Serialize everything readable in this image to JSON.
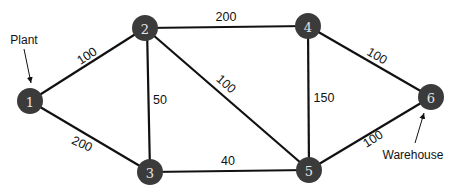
{
  "diagram": {
    "type": "network-graph",
    "nodes": [
      {
        "id": "1",
        "label": "1",
        "x": 30,
        "y": 101
      },
      {
        "id": "2",
        "label": "2",
        "x": 145,
        "y": 28
      },
      {
        "id": "3",
        "label": "3",
        "x": 150,
        "y": 172
      },
      {
        "id": "4",
        "label": "4",
        "x": 308,
        "y": 26
      },
      {
        "id": "5",
        "label": "5",
        "x": 309,
        "y": 170
      },
      {
        "id": "6",
        "label": "6",
        "x": 431,
        "y": 97
      }
    ],
    "edges": [
      {
        "from": "1",
        "to": "2",
        "weight": "100",
        "lx": 87,
        "ly": 56,
        "rot": -33
      },
      {
        "from": "1",
        "to": "3",
        "weight": "200",
        "lx": 82,
        "ly": 144,
        "rot": 25
      },
      {
        "from": "2",
        "to": "3",
        "weight": "50",
        "lx": 160,
        "ly": 100,
        "rot": 0
      },
      {
        "from": "2",
        "to": "4",
        "weight": "200",
        "lx": 226,
        "ly": 18,
        "rot": 0
      },
      {
        "from": "2",
        "to": "5",
        "weight": "100",
        "lx": 228,
        "ly": 84,
        "rot": 42
      },
      {
        "from": "4",
        "to": "5",
        "weight": "150",
        "lx": 324,
        "ly": 97,
        "rot": 0
      },
      {
        "from": "3",
        "to": "5",
        "weight": "40",
        "lx": 228,
        "ly": 162,
        "rot": 0
      },
      {
        "from": "4",
        "to": "6",
        "weight": "100",
        "lx": 377,
        "ly": 56,
        "rot": 30
      },
      {
        "from": "5",
        "to": "6",
        "weight": "100",
        "lx": 374,
        "ly": 139,
        "rot": -32
      }
    ],
    "annotations": [
      {
        "name": "plant",
        "text": "Plant",
        "x": 33,
        "y": 40,
        "target_node": "1"
      },
      {
        "name": "warehouse",
        "text": "Warehouse",
        "x": 413,
        "y": 155,
        "target_node": "6"
      }
    ]
  }
}
